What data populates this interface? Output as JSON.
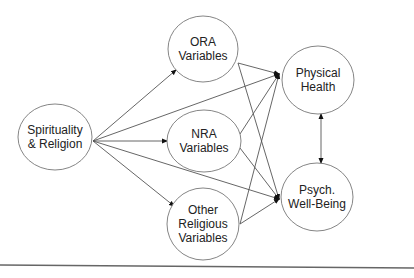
{
  "diagram": {
    "type": "path-model",
    "nodes": [
      {
        "id": "spirituality",
        "label": "Spirituality\n& Religion",
        "cx": 55,
        "cy": 137,
        "rx": 37,
        "ry": 33
      },
      {
        "id": "ora",
        "label": "ORA\nVariables",
        "cx": 203,
        "cy": 49,
        "rx": 35,
        "ry": 33
      },
      {
        "id": "nra",
        "label": "NRA\nVariables",
        "cx": 204,
        "cy": 141,
        "rx": 37,
        "ry": 31
      },
      {
        "id": "other",
        "label": "Other\nReligious\nVariables",
        "cx": 203,
        "cy": 224,
        "rx": 36,
        "ry": 36
      },
      {
        "id": "physical",
        "label": "Physical\nHealth",
        "cx": 318,
        "cy": 80,
        "rx": 36,
        "ry": 34
      },
      {
        "id": "psych",
        "label": "Psych.\nWell-Being",
        "cx": 317,
        "cy": 197,
        "rx": 36,
        "ry": 34
      }
    ],
    "edges": [
      {
        "from": "spirituality",
        "to": "ora",
        "x1": 93,
        "y1": 141,
        "x2": 176,
        "y2": 70,
        "arrow": "end"
      },
      {
        "from": "spirituality",
        "to": "physical",
        "x1": 93,
        "y1": 141,
        "x2": 279,
        "y2": 74,
        "arrow": "end"
      },
      {
        "from": "spirituality",
        "to": "nra",
        "x1": 93,
        "y1": 141,
        "x2": 167,
        "y2": 141,
        "arrow": "end"
      },
      {
        "from": "spirituality",
        "to": "psych",
        "x1": 93,
        "y1": 141,
        "x2": 279,
        "y2": 199,
        "arrow": "end"
      },
      {
        "from": "spirituality",
        "to": "other",
        "x1": 93,
        "y1": 141,
        "x2": 174,
        "y2": 206,
        "arrow": "end"
      },
      {
        "from": "ora",
        "to": "physical",
        "x1": 238,
        "y1": 63,
        "x2": 279,
        "y2": 74,
        "arrow": "end"
      },
      {
        "from": "ora",
        "to": "psych",
        "x1": 238,
        "y1": 63,
        "x2": 279,
        "y2": 199,
        "arrow": "end"
      },
      {
        "from": "nra",
        "to": "physical",
        "x1": 240,
        "y1": 134,
        "x2": 279,
        "y2": 74,
        "arrow": "end"
      },
      {
        "from": "nra",
        "to": "psych",
        "x1": 240,
        "y1": 148,
        "x2": 279,
        "y2": 199,
        "arrow": "end"
      },
      {
        "from": "other",
        "to": "physical",
        "x1": 240,
        "y1": 224,
        "x2": 279,
        "y2": 74,
        "arrow": "end"
      },
      {
        "from": "other",
        "to": "psych",
        "x1": 240,
        "y1": 224,
        "x2": 279,
        "y2": 199,
        "arrow": "end"
      },
      {
        "from": "physical",
        "to": "psych",
        "x1": 321,
        "y1": 114,
        "x2": 321,
        "y2": 163,
        "arrow": "both"
      }
    ],
    "baseline": {
      "x1": 0,
      "y1": 265,
      "x2": 414,
      "y2": 268
    },
    "colors": {
      "stroke": "#555555",
      "circle": "#777777",
      "text": "#222222",
      "arrow": "#111111",
      "baseline": "#666666"
    }
  }
}
